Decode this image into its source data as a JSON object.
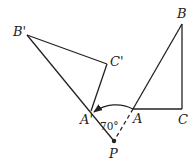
{
  "figure": {
    "type": "rotation-diagram",
    "points": {
      "B_prime": {
        "label": "B'",
        "x": 27,
        "y": 35,
        "lx": 13,
        "ly": 36
      },
      "C_prime": {
        "label": "C'",
        "x": 107,
        "y": 64,
        "lx": 110,
        "ly": 66
      },
      "A_prime": {
        "label": "A'",
        "x": 91,
        "y": 111,
        "lx": 80,
        "ly": 124
      },
      "A": {
        "label": "A",
        "x": 133,
        "y": 109,
        "lx": 133,
        "ly": 123
      },
      "B": {
        "label": "B",
        "x": 182,
        "y": 24,
        "lx": 177,
        "ly": 18
      },
      "C": {
        "label": "C",
        "x": 182,
        "y": 109,
        "lx": 178,
        "ly": 124
      },
      "P": {
        "label": "P",
        "x": 114,
        "y": 141,
        "lx": 109,
        "ly": 158
      }
    },
    "angle_label": "70°",
    "angle_label_pos": {
      "x": 100,
      "y": 130
    },
    "segments": [
      {
        "from": "B_prime",
        "to": "C_prime",
        "style": "solid"
      },
      {
        "from": "C_prime",
        "to": "A_prime",
        "style": "solid"
      },
      {
        "from": "B_prime",
        "to": "P",
        "style": "solid"
      },
      {
        "from": "A",
        "to": "B",
        "style": "solid"
      },
      {
        "from": "B",
        "to": "C",
        "style": "solid"
      },
      {
        "from": "A",
        "to": "C",
        "style": "solid"
      },
      {
        "from": "A",
        "to": "P",
        "style": "dashed"
      }
    ],
    "arc": {
      "from": "A",
      "to": "A_prime",
      "arrow": "end"
    }
  }
}
